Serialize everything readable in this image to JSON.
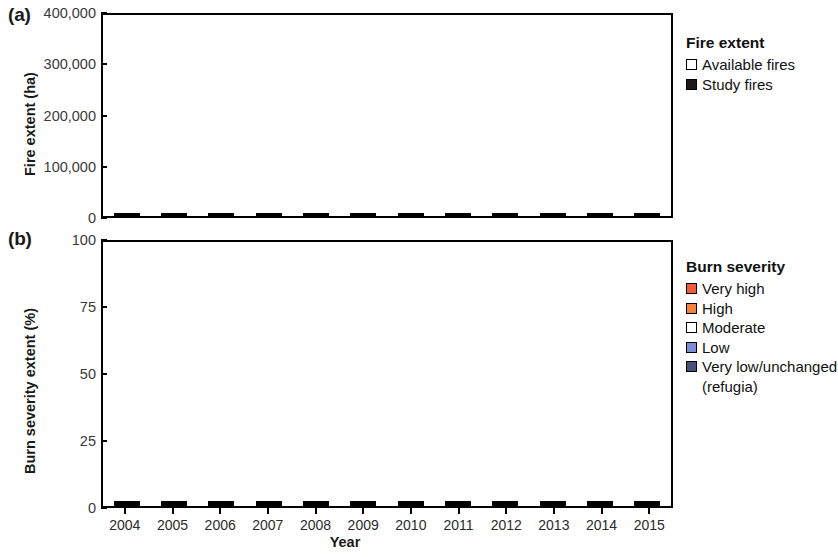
{
  "panels": {
    "a": {
      "label": "(a)",
      "ylabel": "Fire extent (ha)"
    },
    "b": {
      "label": "(b)",
      "ylabel": "Burn severity extent (%)"
    }
  },
  "xlabel": "Year",
  "colors": {
    "very_high": "#F15D3A",
    "high": "#F4803F",
    "moderate": "#FFFFFF",
    "low": "#7C8FD4",
    "very_low": "#474E77",
    "study_fires": "#1A1A1A",
    "available_fires": "#FFFFFF",
    "axis": "#000000"
  },
  "legend_a": {
    "title": "Fire extent",
    "items": [
      {
        "label": "Available fires",
        "color": "#FFFFFF"
      },
      {
        "label": "Study fires",
        "color": "#1A1A1A"
      }
    ]
  },
  "legend_b": {
    "title": "Burn severity",
    "items": [
      {
        "label": "Very high",
        "color": "#F15D3A"
      },
      {
        "label": "High",
        "color": "#F4803F"
      },
      {
        "label": "Moderate",
        "color": "#FFFFFF"
      },
      {
        "label": "Low",
        "color": "#7C8FD4"
      },
      {
        "label": "Very low/unchanged",
        "color": "#474E77"
      }
    ],
    "continuation": "(refugia)"
  },
  "chart_data": [
    {
      "type": "bar",
      "id": "panel-a",
      "title": "(a)",
      "stacked": true,
      "xlabel": "Year",
      "ylabel": "Fire extent (ha)",
      "ylim": [
        0,
        400000
      ],
      "yticks": [
        0,
        100000,
        200000,
        300000,
        400000
      ],
      "ytick_labels": [
        "0",
        "100,000",
        "200,000",
        "300,000",
        "400,000"
      ],
      "grid": false,
      "legend_position": "right",
      "categories": [
        "2004",
        "2005",
        "2006",
        "2007",
        "2008",
        "2009",
        "2010",
        "2011",
        "2012",
        "2013",
        "2014",
        "2015"
      ],
      "series": [
        {
          "name": "Study fires",
          "color": "#1A1A1A",
          "values": [
            19000,
            25000,
            130000,
            17000,
            4000,
            13000,
            6000,
            11000,
            71000,
            39000,
            80000,
            228000
          ]
        },
        {
          "name": "Available fires",
          "color": "#FFFFFF",
          "values": [
            8000,
            8000,
            23000,
            66000,
            30000,
            13000,
            4000,
            19000,
            2000,
            19000,
            33000,
            120000
          ]
        }
      ],
      "totals": [
        27000,
        33000,
        153000,
        83000,
        34000,
        26000,
        10000,
        30000,
        73000,
        58000,
        113000,
        348000
      ]
    },
    {
      "type": "bar",
      "id": "panel-b",
      "title": "(b)",
      "stacked": true,
      "stack_total": 100,
      "xlabel": "Year",
      "ylabel": "Burn severity extent (%)",
      "ylim": [
        0,
        100
      ],
      "yticks": [
        0,
        25,
        50,
        75,
        100
      ],
      "ytick_labels": [
        "0",
        "25",
        "50",
        "75",
        "100"
      ],
      "grid": false,
      "legend_position": "right",
      "categories": [
        "2004",
        "2005",
        "2006",
        "2007",
        "2008",
        "2009",
        "2010",
        "2011",
        "2012",
        "2013",
        "2014",
        "2015"
      ],
      "series": [
        {
          "name": "Very low/unchanged (refugia)",
          "color": "#474E77",
          "values": [
            14.5,
            48.5,
            39.0,
            26.5,
            60.0,
            29.5,
            33.5,
            41.5,
            39.5,
            37.5,
            60.0,
            29.0
          ]
        },
        {
          "name": "Low",
          "color": "#7C8FD4",
          "values": [
            3.0,
            3.5,
            3.0,
            4.5,
            2.5,
            1.5,
            5.0,
            3.5,
            5.5,
            8.5,
            7.5,
            6.5
          ]
        },
        {
          "name": "Moderate",
          "color": "#FFFFFF",
          "values": [
            32.5,
            28.5,
            26.0,
            37.0,
            13.5,
            40.0,
            32.5,
            26.5,
            30.0,
            23.0,
            26.0,
            36.5
          ]
        },
        {
          "name": "High",
          "color": "#F4803F",
          "values": [
            16.5,
            10.5,
            7.5,
            11.0,
            8.5,
            5.5,
            9.0,
            8.5,
            10.0,
            13.0,
            3.0,
            10.0
          ]
        },
        {
          "name": "Very high",
          "color": "#F15D3A",
          "values": [
            33.5,
            9.0,
            24.5,
            21.0,
            15.5,
            23.5,
            20.0,
            20.0,
            15.0,
            18.0,
            3.5,
            18.0
          ]
        }
      ]
    }
  ]
}
